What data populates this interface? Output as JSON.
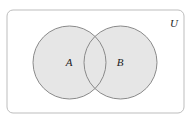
{
  "diagram": {
    "type": "venn",
    "universe": {
      "label": "U",
      "x": 7,
      "y": 10,
      "width": 177,
      "height": 103,
      "corner_radius": 6,
      "stroke": "#bdbdbd",
      "fill": "#ffffff"
    },
    "sets": [
      {
        "label": "A",
        "cx": 69.5,
        "cy": 62.5,
        "r": 36.5,
        "fill": "#e6e6e6",
        "stroke": "#8a8a8a"
      },
      {
        "label": "B",
        "cx": 120.5,
        "cy": 62.5,
        "r": 36.5,
        "fill": "#e6e6e6",
        "stroke": "#8a8a8a"
      }
    ]
  }
}
